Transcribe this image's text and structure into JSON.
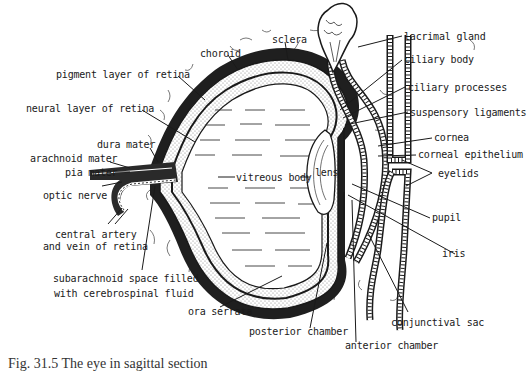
{
  "figure": {
    "caption": "Fig. 31.5  The eye in sagittal section",
    "colors": {
      "ink": "#1a1a1a",
      "background": "#ffffff",
      "stipple": "#9a9a9a"
    }
  },
  "labels": {
    "choroid": "choroid",
    "sclera": "sclera",
    "pigment_layer": "pigment layer of retina",
    "neural_layer": "neural layer of retina",
    "dura_mater": "dura mater",
    "arachnoid_mater": "arachnoid mater",
    "pia_mater": "pia mater",
    "optic_nerve": "optic nerve",
    "central_artery_1": "central artery",
    "central_artery_2": "and vein of retina",
    "subarachnoid_1": "subarachnoid space filled",
    "subarachnoid_2": "with cerebrospinal fluid",
    "ora_serrata": "ora serrata",
    "posterior_chamber": "posterior chamber",
    "anterior_chamber": "anterior chamber",
    "vitreous_body": "vitreous body",
    "lens": "lens",
    "lacrimal_gland": "lacrimal gland",
    "ciliary_body": "ciliary body",
    "ciliary_processes": "ciliary processes",
    "suspensory_ligaments": "suspensory ligaments",
    "cornea": "cornea",
    "corneal_epithelium": "corneal epithelium",
    "eyelids": "eyelids",
    "pupil": "pupil",
    "iris": "iris",
    "conjunctival_sac": "conjunctival sac"
  }
}
